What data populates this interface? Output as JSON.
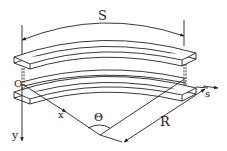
{
  "diagram": {
    "labels": {
      "arc_length": "S",
      "origin": "O",
      "x_axis": "x",
      "y_axis": "y",
      "s_axis": "s",
      "angle": "Θ",
      "radius": "R"
    },
    "colors": {
      "line": "#222222",
      "background": "#ffffff"
    }
  }
}
